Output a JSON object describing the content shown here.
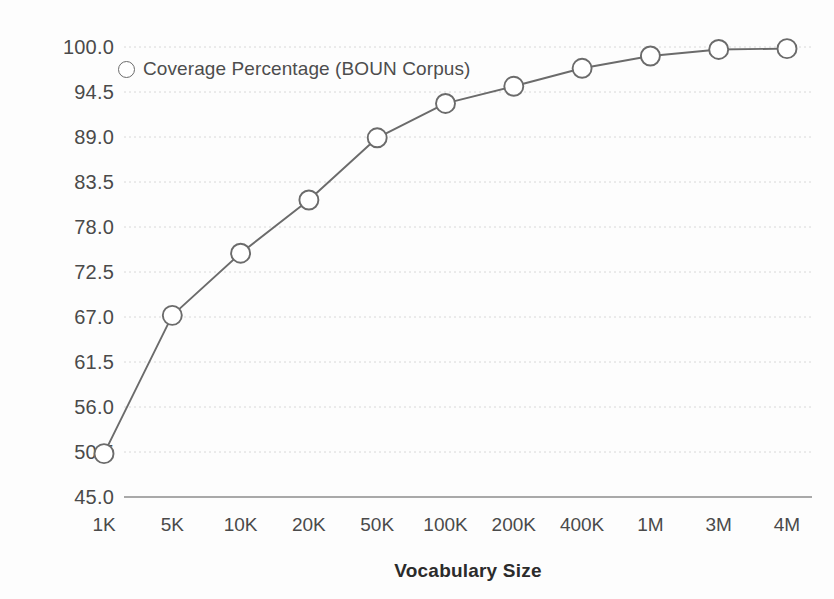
{
  "chart_data": {
    "type": "line",
    "title": "",
    "xlabel": "Vocabulary Size",
    "ylabel": "",
    "categories": [
      "1K",
      "5K",
      "10K",
      "20K",
      "50K",
      "100K",
      "200K",
      "400K",
      "1M",
      "3M",
      "4M"
    ],
    "series": [
      {
        "name": "Coverage Percentage (BOUN Corpus)",
        "marker": "open-circle",
        "color": "#6b6b6b",
        "values": [
          50.3,
          67.2,
          74.8,
          81.3,
          88.9,
          93.1,
          95.2,
          97.4,
          98.9,
          99.7,
          99.8
        ]
      }
    ],
    "yticks": [
      "45.0",
      "50.5",
      "56.0",
      "61.5",
      "67.0",
      "72.5",
      "78.0",
      "83.5",
      "89.0",
      "94.5",
      "100.0"
    ],
    "ytick_values": [
      45.0,
      50.5,
      56.0,
      61.5,
      67.0,
      72.5,
      78.0,
      83.5,
      89.0,
      94.5,
      100.0
    ],
    "ylim": [
      45.0,
      100.0
    ],
    "grid": true,
    "grid_axis": "y",
    "legend_position": "top-left",
    "xaxis_scale": "categorical"
  },
  "legend": {
    "entries": [
      {
        "label": "Coverage Percentage (BOUN Corpus)",
        "marker": "open-circle"
      }
    ]
  },
  "axes": {
    "x_title": "Vocabulary Size"
  },
  "colors": {
    "line": "#6b6b6b",
    "marker_stroke": "#6b6b6b",
    "marker_fill": "#ffffff",
    "grid": "#d8d8d8",
    "axis_line": "#8c8c8c",
    "tick_text": "#4a4a4a",
    "background": "#fdfdfd"
  }
}
